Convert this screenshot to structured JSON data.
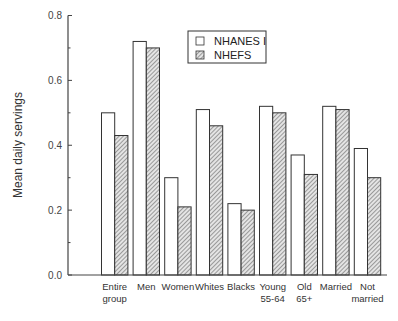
{
  "chart_data": {
    "type": "bar",
    "title": "",
    "xlabel": "",
    "ylabel": "Mean daily servings",
    "ylim": [
      0.0,
      0.8
    ],
    "yticks": [
      "0.0",
      "0.2",
      "0.4",
      "0.6",
      "0.8"
    ],
    "grid": false,
    "legend_position": "top-center",
    "categories": [
      [
        "Entire",
        "group"
      ],
      [
        "Men"
      ],
      [
        "Women"
      ],
      [
        "Whites"
      ],
      [
        "Blacks"
      ],
      [
        "Young",
        "55-64"
      ],
      [
        "Old",
        "65+"
      ],
      [
        "Married"
      ],
      [
        "Not",
        "married"
      ]
    ],
    "series": [
      {
        "name": "NHANES I",
        "fill": "#ffffff",
        "pattern": "none",
        "values": [
          0.5,
          0.72,
          0.3,
          0.51,
          0.22,
          0.52,
          0.37,
          0.52,
          0.39
        ]
      },
      {
        "name": "NHEFS",
        "fill": "#c8c8c8",
        "pattern": "hatch",
        "values": [
          0.43,
          0.7,
          0.21,
          0.46,
          0.2,
          0.5,
          0.31,
          0.51,
          0.3
        ]
      }
    ]
  },
  "colors": {
    "axis": "#444444",
    "bar_stroke": "#333333",
    "hatch": "#555555"
  }
}
